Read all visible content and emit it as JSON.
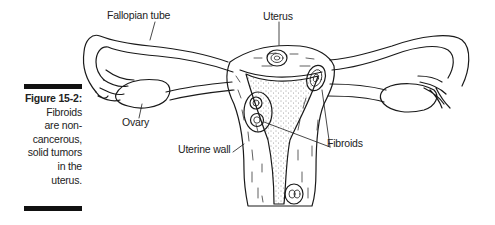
{
  "figure": {
    "number": "Figure 15-2:",
    "caption_lines": [
      "Fibroids",
      "are non-",
      "cancerous,",
      "solid tumors",
      "in the",
      "uterus."
    ],
    "caption": "Fibroids are non-cancerous, solid tumors in the uterus."
  },
  "diagram": {
    "labels": {
      "fallopian_tube": "Fallopian tube",
      "uterus": "Uterus",
      "ovary": "Ovary",
      "uterine_wall": "Uterine wall",
      "fibroids": "Fibroids"
    },
    "colors": {
      "line": "#1a1a1a",
      "background": "#ffffff",
      "bar": "#111111"
    }
  }
}
